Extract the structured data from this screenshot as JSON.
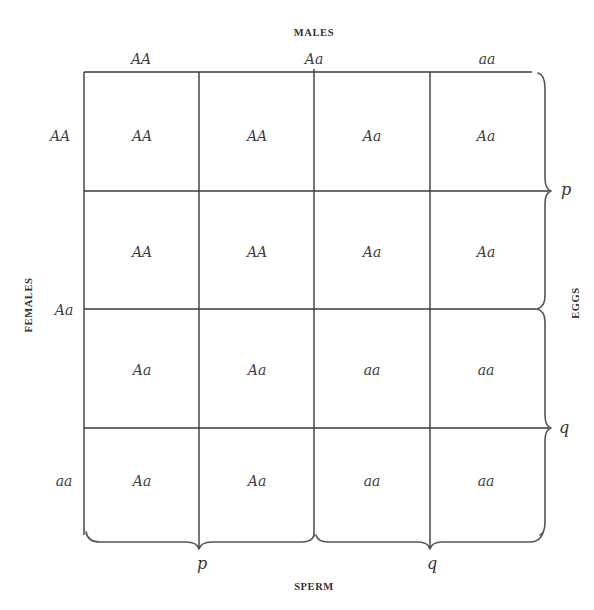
{
  "diagram": {
    "top_axis_title": "MALES",
    "left_axis_title": "FEMALES",
    "right_axis_title": "EGGS",
    "bottom_axis_title": "SPERM",
    "column_headers": [
      "AA",
      "Aa",
      "aa"
    ],
    "row_headers": [
      "AA",
      "Aa",
      "aa"
    ],
    "cells": [
      [
        "AA",
        "AA",
        "Aa",
        "Aa"
      ],
      [
        "AA",
        "AA",
        "Aa",
        "Aa"
      ],
      [
        "Aa",
        "Aa",
        "aa",
        "aa"
      ],
      [
        "Aa",
        "Aa",
        "aa",
        "aa"
      ]
    ],
    "egg_frequencies": {
      "upper": "p",
      "lower": "q"
    },
    "sperm_frequencies": {
      "left": "p",
      "right": "q"
    },
    "colors": {
      "line": "#3a3a3a",
      "text": "#3d3d3d",
      "background": "#ffffff"
    }
  }
}
